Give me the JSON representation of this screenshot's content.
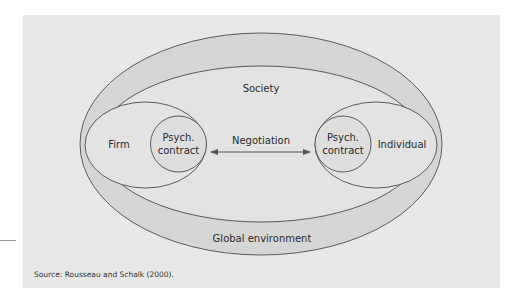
{
  "diagram": {
    "outer_label": "Global environment",
    "middle_label": "Society",
    "left_party": "Firm",
    "right_party": "Individual",
    "left_contract": [
      "Psych.",
      "contract"
    ],
    "right_contract": [
      "Psych.",
      "contract"
    ],
    "link_label": "Negotiation",
    "link_type": "bidirectional-arrow"
  },
  "source": "Source: Rousseau and Schalk (2000).",
  "colors": {
    "panel": "#e8e8e8",
    "outer_ring": "#d6d6d6",
    "inner_fill": "#e3e3e3",
    "stroke": "#3a3a3a"
  }
}
